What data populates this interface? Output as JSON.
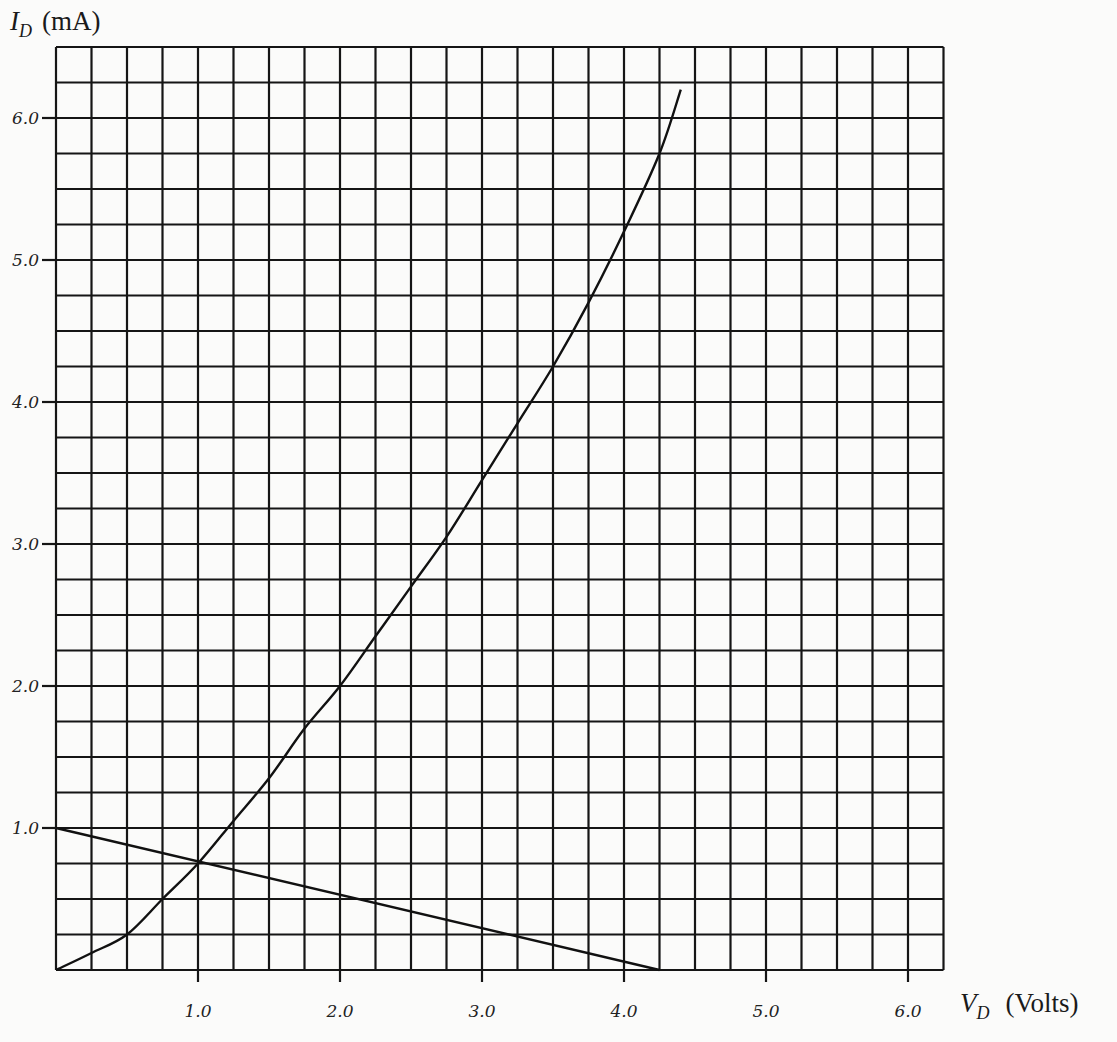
{
  "chart_data": {
    "type": "line",
    "title": "",
    "xlabel": "V_D (Volts)",
    "ylabel": "I_D (mA)",
    "x_axis": {
      "symbol": "V",
      "subscript": "D",
      "unit": "(Volts)",
      "range": [
        0,
        6.25
      ],
      "minor_step": 0.25,
      "ticks": [
        1.0,
        2.0,
        3.0,
        4.0,
        5.0,
        6.0
      ],
      "tick_labels": [
        "1.0",
        "2.0",
        "3.0",
        "4.0",
        "5.0",
        "6.0"
      ]
    },
    "y_axis": {
      "symbol": "I",
      "subscript": "D",
      "unit": "(mA)",
      "range": [
        0,
        6.5
      ],
      "minor_step": 0.25,
      "ticks": [
        1.0,
        2.0,
        3.0,
        4.0,
        5.0,
        6.0
      ],
      "tick_labels": [
        "1.0",
        "2.0",
        "3.0",
        "4.0",
        "5.0",
        "6.0"
      ]
    },
    "grid": true,
    "legend": "none",
    "series": [
      {
        "name": "Diode I-V characteristic",
        "x": [
          0,
          0.25,
          0.5,
          0.75,
          1.0,
          1.25,
          1.5,
          1.75,
          2.0,
          2.25,
          2.5,
          2.75,
          3.0,
          3.25,
          3.5,
          3.75,
          4.0,
          4.25,
          4.4
        ],
        "y": [
          0,
          0.12,
          0.25,
          0.5,
          0.75,
          1.05,
          1.35,
          1.7,
          2.0,
          2.35,
          2.7,
          3.05,
          3.45,
          3.85,
          4.25,
          4.7,
          5.2,
          5.75,
          6.2
        ]
      },
      {
        "name": "Load line",
        "x": [
          0,
          4.25
        ],
        "y": [
          1.0,
          0
        ]
      }
    ],
    "annotations": {
      "operating_point": {
        "x": 1.0,
        "y": 0.75
      }
    }
  }
}
